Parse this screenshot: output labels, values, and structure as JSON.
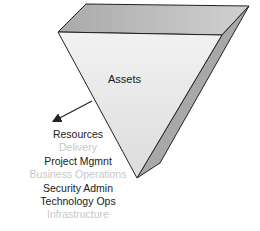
{
  "diagram": {
    "title": "Assets",
    "shape": "inverted-pyramid",
    "colors": {
      "top_face": "#b8b8b8",
      "front_face": "#e6e6e6",
      "side_face": "#a8a8a8",
      "outline": "#222222",
      "active_text": "#1a1a1a",
      "inactive_text": "#c8c8c8"
    },
    "list": [
      {
        "label": "Resources",
        "state": "active"
      },
      {
        "label": "Delivery",
        "state": "inactive"
      },
      {
        "label": "Project Mgmnt",
        "state": "active"
      },
      {
        "label": "Business Operations",
        "state": "inactive"
      },
      {
        "label": "Security Admin",
        "state": "active"
      },
      {
        "label": "Technology Ops",
        "state": "active"
      },
      {
        "label": "Infrastructure",
        "state": "inactive"
      }
    ]
  }
}
